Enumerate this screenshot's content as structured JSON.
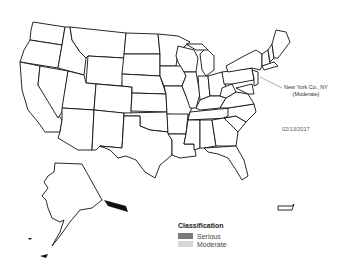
{
  "map": {
    "region": "United States",
    "date_label": "02/13/2017",
    "annotation": {
      "line1": "New York Co., NY",
      "line2": "(Moderate)"
    },
    "colors": {
      "serious": "#7a7a7a",
      "moderate": "#d6d6d6",
      "border": "#111111",
      "background": "#ffffff"
    }
  },
  "legend": {
    "title": "Classification",
    "items": [
      {
        "label": "Serious",
        "color": "#7a7a7a"
      },
      {
        "label": "Moderate",
        "color": "#d6d6d6"
      }
    ]
  }
}
